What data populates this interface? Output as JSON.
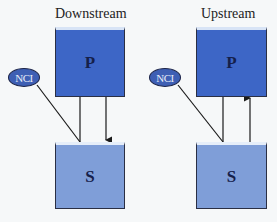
{
  "panels": [
    {
      "title": "Downstream",
      "top_box": "P",
      "bottom_box": "S",
      "modulator": "NCI",
      "arrow_direction": "P to S"
    },
    {
      "title": "Upstream",
      "top_box": "P",
      "bottom_box": "S",
      "modulator": "NCI",
      "arrow_direction": "S to P"
    }
  ],
  "colors": {
    "p_box": "#3d66c6",
    "s_box": "#7f9ed8",
    "nci": "#3e5fb4",
    "line": "#1a1a1a"
  }
}
